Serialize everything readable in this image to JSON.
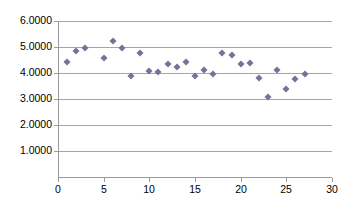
{
  "chart_data": {
    "type": "scatter",
    "title": "",
    "subtitle": "",
    "xlabel": "",
    "ylabel": "",
    "xlim": [
      0,
      30
    ],
    "ylim": [
      0,
      6
    ],
    "grid": true,
    "grid_axis": "y",
    "legend": false,
    "legend_position": "none",
    "marker": "diamond",
    "marker_color": "#72729c",
    "x_ticks": [
      0,
      5,
      10,
      15,
      20,
      25,
      30
    ],
    "x_tick_labels": [
      "0",
      "5",
      "10",
      "15",
      "20",
      "25",
      "30"
    ],
    "y_ticks": [
      1,
      2,
      3,
      4,
      5,
      6
    ],
    "y_tick_labels": [
      "1.0000",
      "2.0000",
      "3.0000",
      "4.0000",
      "5.0000",
      "6.0000"
    ],
    "series": [
      {
        "name": "Series1",
        "points": [
          {
            "x": 1,
            "y": 4.41
          },
          {
            "x": 2,
            "y": 4.83
          },
          {
            "x": 3,
            "y": 4.95
          },
          {
            "x": 5,
            "y": 4.57
          },
          {
            "x": 6,
            "y": 5.24
          },
          {
            "x": 7,
            "y": 4.98
          },
          {
            "x": 8,
            "y": 3.88
          },
          {
            "x": 9,
            "y": 4.76
          },
          {
            "x": 10,
            "y": 4.09
          },
          {
            "x": 11,
            "y": 4.05
          },
          {
            "x": 12,
            "y": 4.33
          },
          {
            "x": 13,
            "y": 4.24
          },
          {
            "x": 14,
            "y": 4.43
          },
          {
            "x": 15,
            "y": 3.87
          },
          {
            "x": 16,
            "y": 4.1
          },
          {
            "x": 17,
            "y": 3.96
          },
          {
            "x": 18,
            "y": 4.78
          },
          {
            "x": 19,
            "y": 4.69
          },
          {
            "x": 20,
            "y": 4.34
          },
          {
            "x": 21,
            "y": 4.38
          },
          {
            "x": 22,
            "y": 3.81
          },
          {
            "x": 23,
            "y": 3.06
          },
          {
            "x": 24,
            "y": 4.1
          },
          {
            "x": 25,
            "y": 3.38
          },
          {
            "x": 26,
            "y": 3.78
          },
          {
            "x": 27,
            "y": 3.98
          }
        ]
      }
    ]
  },
  "axes": {
    "y_tick_labels": [
      "6.0000",
      "5.0000",
      "4.0000",
      "3.0000",
      "2.0000",
      "1.0000"
    ],
    "x_tick_labels": [
      "0",
      "5",
      "10",
      "15",
      "20",
      "25",
      "30"
    ]
  }
}
